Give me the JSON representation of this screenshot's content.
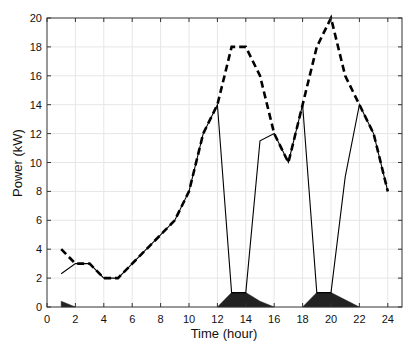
{
  "chart_data": {
    "type": "line",
    "title": "",
    "xlabel": "Time (hour)",
    "ylabel": "Power (kW)",
    "xlim": [
      0,
      25
    ],
    "ylim": [
      0,
      20
    ],
    "xticks": [
      0,
      2,
      4,
      6,
      8,
      10,
      12,
      14,
      16,
      18,
      20,
      22,
      24
    ],
    "yticks": [
      0,
      2,
      4,
      6,
      8,
      10,
      12,
      14,
      16,
      18,
      20
    ],
    "grid": true,
    "legend": null,
    "series": [
      {
        "name": "dashed",
        "style": "dashed",
        "color": "#000000",
        "x": [
          1,
          2,
          3,
          4,
          5,
          6,
          7,
          8,
          9,
          10,
          11,
          12,
          13,
          14,
          15,
          16,
          17,
          18,
          19,
          20,
          21,
          22,
          23,
          24
        ],
        "values": [
          4,
          3,
          3,
          2,
          2,
          3,
          4,
          5,
          6,
          8,
          12,
          14,
          18,
          18,
          16,
          12,
          10,
          14,
          18,
          20,
          16,
          14,
          12,
          8
        ]
      },
      {
        "name": "solid",
        "style": "solid",
        "color": "#000000",
        "x": [
          1,
          2,
          3,
          4,
          5,
          6,
          7,
          8,
          9,
          10,
          11,
          12,
          13,
          14,
          15,
          16,
          17,
          18,
          19,
          20,
          21,
          22,
          23,
          24
        ],
        "values": [
          2.3,
          3,
          3,
          2,
          2,
          3,
          4,
          5,
          6,
          8,
          12,
          14,
          1,
          1,
          11.5,
          12,
          10,
          14,
          1,
          1,
          9,
          14,
          12,
          8
        ]
      },
      {
        "name": "filled",
        "style": "area",
        "color": "#222222",
        "x": [
          1,
          2,
          3,
          4,
          5,
          6,
          7,
          8,
          9,
          10,
          11,
          12,
          13,
          14,
          15,
          16,
          17,
          18,
          19,
          20,
          21,
          22,
          23,
          24
        ],
        "values": [
          0.4,
          0,
          0,
          0,
          0,
          0,
          0,
          0,
          0,
          0,
          0,
          0,
          1,
          1,
          0.4,
          0,
          0,
          0,
          1,
          1,
          0.5,
          0,
          0,
          0
        ]
      }
    ]
  }
}
